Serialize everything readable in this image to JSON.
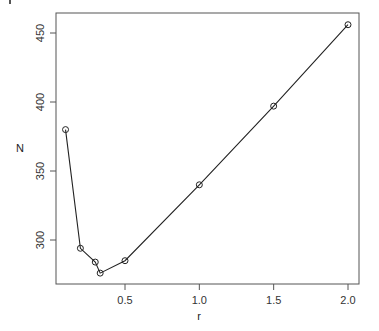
{
  "chart_data": {
    "type": "line",
    "title": "",
    "xlabel": "r",
    "ylabel": "N",
    "x": [
      0.1,
      0.2,
      0.3,
      0.333,
      0.5,
      1.0,
      1.5,
      2.0
    ],
    "series": [
      {
        "name": "N",
        "values": [
          380,
          294,
          284,
          276,
          285,
          340,
          397,
          456
        ],
        "marker": "open-circle",
        "color": "#222222"
      }
    ],
    "xticks": [
      0.5,
      1.0,
      1.5,
      2.0
    ],
    "xtick_labels": [
      "0.5",
      "1.0",
      "1.5",
      "2.0"
    ],
    "yticks": [
      300,
      350,
      400,
      450
    ],
    "ytick_labels": [
      "300",
      "350",
      "400",
      "450"
    ],
    "xlim": [
      0.05,
      2.07
    ],
    "ylim": [
      270,
      463
    ],
    "grid": false,
    "legend": false
  }
}
